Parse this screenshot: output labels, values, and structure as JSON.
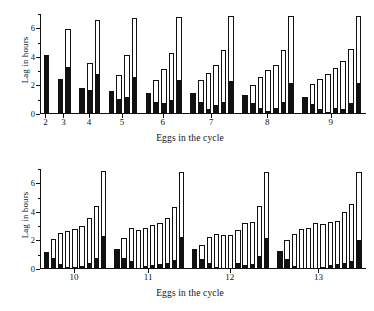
{
  "figure": {
    "background": "#ffffff",
    "bar_fill_lower": "#111111",
    "bar_fill_upper": "#ffffff",
    "bar_stroke": "#111111"
  },
  "chart_data": [
    {
      "type": "bar",
      "subtype": "stacked",
      "panel": "top",
      "title": "",
      "xlabel": "Eggs in the cycle",
      "ylabel": "Lag in hours",
      "ylim": [
        0,
        7
      ],
      "yticks": [
        0,
        2,
        4,
        6
      ],
      "ytick_labels": [
        "0",
        "2",
        "4",
        "6"
      ],
      "yminor_ticks": [
        1,
        3,
        5,
        7
      ],
      "grid": false,
      "legend": "none",
      "categories": [
        "2",
        "3",
        "4",
        "5",
        "6",
        "7",
        "8",
        "9"
      ],
      "series": [
        {
          "name": "black segment",
          "color": "#111111"
        },
        {
          "name": "open segment",
          "color": "#ffffff"
        }
      ],
      "groups": [
        {
          "category": "2",
          "bars": [
            {
              "lower": 4.15,
              "total": 4.15
            }
          ]
        },
        {
          "category": "3",
          "bars": [
            {
              "lower": 2.45,
              "total": 2.45
            },
            {
              "lower": 3.3,
              "total": 5.95
            }
          ]
        },
        {
          "category": "4",
          "bars": [
            {
              "lower": 1.85,
              "total": 1.85
            },
            {
              "lower": 1.7,
              "total": 3.55
            },
            {
              "lower": 2.8,
              "total": 6.55
            }
          ]
        },
        {
          "category": "5",
          "bars": [
            {
              "lower": 1.6,
              "total": 1.6
            },
            {
              "lower": 1.05,
              "total": 2.75
            },
            {
              "lower": 1.2,
              "total": 4.15
            },
            {
              "lower": 2.6,
              "total": 6.7
            }
          ]
        },
        {
          "category": "6",
          "bars": [
            {
              "lower": 1.45,
              "total": 1.45
            },
            {
              "lower": 0.85,
              "total": 2.35
            },
            {
              "lower": 0.75,
              "total": 3.15
            },
            {
              "lower": 1.0,
              "total": 4.3
            },
            {
              "lower": 2.4,
              "total": 6.8
            }
          ]
        },
        {
          "category": "7",
          "bars": [
            {
              "lower": 1.5,
              "total": 1.5
            },
            {
              "lower": 0.85,
              "total": 2.4
            },
            {
              "lower": 0.35,
              "total": 2.85
            },
            {
              "lower": 0.6,
              "total": 3.45
            },
            {
              "lower": 0.85,
              "total": 4.45
            },
            {
              "lower": 2.3,
              "total": 6.85
            }
          ]
        },
        {
          "category": "8",
          "bars": [
            {
              "lower": 1.3,
              "total": 1.3
            },
            {
              "lower": 0.75,
              "total": 2.05
            },
            {
              "lower": 0.4,
              "total": 2.6
            },
            {
              "lower": 0.2,
              "total": 3.05
            },
            {
              "lower": 0.4,
              "total": 3.45
            },
            {
              "lower": 0.85,
              "total": 4.45
            },
            {
              "lower": 2.2,
              "total": 6.85
            }
          ]
        },
        {
          "category": "9",
          "bars": [
            {
              "lower": 1.2,
              "total": 1.2
            },
            {
              "lower": 0.7,
              "total": 2.1
            },
            {
              "lower": 0.35,
              "total": 2.45
            },
            {
              "lower": 0.15,
              "total": 2.8
            },
            {
              "lower": 0.45,
              "total": 3.25
            },
            {
              "lower": 0.35,
              "total": 3.7
            },
            {
              "lower": 0.8,
              "total": 4.55
            },
            {
              "lower": 2.2,
              "total": 6.85
            }
          ]
        }
      ]
    },
    {
      "type": "bar",
      "subtype": "stacked",
      "panel": "bottom",
      "title": "",
      "xlabel": "Eggs in the cycle",
      "ylabel": "Lag in hours",
      "ylim": [
        0,
        7
      ],
      "yticks": [
        0,
        2,
        4,
        6
      ],
      "ytick_labels": [
        "0",
        "2",
        "4",
        "6"
      ],
      "yminor_ticks": [
        1,
        3,
        5,
        7
      ],
      "grid": false,
      "legend": "none",
      "categories": [
        "10",
        "11",
        "12",
        "13"
      ],
      "series": [
        {
          "name": "black segment",
          "color": "#111111"
        },
        {
          "name": "open segment",
          "color": "#ffffff"
        }
      ],
      "groups": [
        {
          "category": "10",
          "bars": [
            {
              "lower": 1.2,
              "total": 1.2
            },
            {
              "lower": 0.8,
              "total": 2.1
            },
            {
              "lower": 0.35,
              "total": 2.55
            },
            {
              "lower": 0.15,
              "total": 2.65
            },
            {
              "lower": 0.15,
              "total": 2.8
            },
            {
              "lower": 0.2,
              "total": 3.0
            },
            {
              "lower": 0.45,
              "total": 3.55
            },
            {
              "lower": 0.8,
              "total": 4.4
            },
            {
              "lower": 2.3,
              "total": 6.85
            }
          ]
        },
        {
          "category": "11",
          "bars": [
            {
              "lower": 1.4,
              "total": 1.4
            },
            {
              "lower": 0.75,
              "total": 2.2
            },
            {
              "lower": 0.55,
              "total": 2.85
            },
            {
              "lower": 0.1,
              "total": 2.7
            },
            {
              "lower": 0.2,
              "total": 2.85
            },
            {
              "lower": 0.25,
              "total": 3.05
            },
            {
              "lower": 0.35,
              "total": 3.2
            },
            {
              "lower": 0.4,
              "total": 3.6
            },
            {
              "lower": 0.65,
              "total": 4.35
            },
            {
              "lower": 2.25,
              "total": 6.8
            }
          ]
        },
        {
          "category": "12",
          "bars": [
            {
              "lower": 1.4,
              "total": 1.4
            },
            {
              "lower": 0.7,
              "total": 1.7
            },
            {
              "lower": 0.4,
              "total": 2.25
            },
            {
              "lower": 0.15,
              "total": 2.45
            },
            {
              "lower": 0.1,
              "total": 2.4
            },
            {
              "lower": 0.05,
              "total": 2.35
            },
            {
              "lower": 0.4,
              "total": 2.75
            },
            {
              "lower": 0.25,
              "total": 3.2
            },
            {
              "lower": 0.35,
              "total": 3.3
            },
            {
              "lower": 0.9,
              "total": 4.4
            },
            {
              "lower": 2.15,
              "total": 6.8
            }
          ]
        },
        {
          "category": "13",
          "bars": [
            {
              "lower": 1.25,
              "total": 1.25
            },
            {
              "lower": 0.7,
              "total": 2.05
            },
            {
              "lower": 0.2,
              "total": 2.45
            },
            {
              "lower": 0.1,
              "total": 2.8
            },
            {
              "lower": 0.1,
              "total": 2.9
            },
            {
              "lower": 0.05,
              "total": 3.2
            },
            {
              "lower": 0.15,
              "total": 3.15
            },
            {
              "lower": 0.3,
              "total": 3.3
            },
            {
              "lower": 0.35,
              "total": 3.35
            },
            {
              "lower": 0.4,
              "total": 4.0
            },
            {
              "lower": 0.55,
              "total": 4.55
            },
            {
              "lower": 2.0,
              "total": 6.8
            }
          ]
        }
      ]
    }
  ]
}
